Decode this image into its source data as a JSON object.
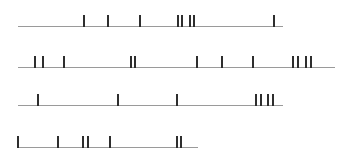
{
  "diagram": {
    "type": "event-timelines",
    "colors": {
      "baseline": "#9a9a9a",
      "tick": "#2e2e2e",
      "background": "#ffffff"
    },
    "tick_height": 11,
    "timelines": [
      {
        "id": "row-1",
        "y": 26,
        "x_start": 18,
        "x_end": 283,
        "ticks": [
          83,
          107,
          139,
          177,
          181,
          189,
          193,
          273
        ]
      },
      {
        "id": "row-2",
        "y": 67,
        "x_start": 18,
        "x_end": 335,
        "ticks": [
          34,
          42,
          63,
          130,
          134,
          196,
          221,
          252,
          292,
          297,
          305,
          310
        ]
      },
      {
        "id": "row-3",
        "y": 105,
        "x_start": 18,
        "x_end": 283,
        "ticks": [
          37,
          117,
          176,
          255,
          260,
          267,
          272
        ]
      },
      {
        "id": "row-4",
        "y": 147,
        "x_start": 17,
        "x_end": 198,
        "ticks": [
          17,
          57,
          82,
          87,
          109,
          176,
          180
        ]
      }
    ]
  }
}
